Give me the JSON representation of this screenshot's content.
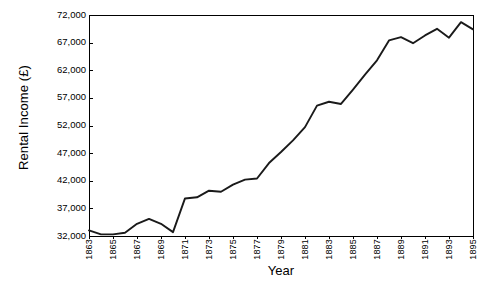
{
  "chart_data": {
    "type": "line",
    "title": "",
    "xlabel": "Year",
    "ylabel": "Rental Income (£)",
    "xlim": [
      1863,
      1895
    ],
    "ylim": [
      32000,
      72000
    ],
    "grid": false,
    "legend": "none",
    "ytick_labels": [
      "72,000",
      "67,000",
      "62,000",
      "57,000",
      "52,000",
      "47,000",
      "42,000",
      "37,000",
      "32,000"
    ],
    "ytick_values": [
      72000,
      67000,
      62000,
      57000,
      52000,
      47000,
      42000,
      37000,
      32000
    ],
    "xtick_labels": [
      "1863",
      "1865",
      "1867",
      "1869",
      "1871",
      "1873",
      "1875",
      "1877",
      "1879",
      "1881",
      "1883",
      "1885",
      "1887",
      "1889",
      "1891",
      "1893",
      "1895"
    ],
    "xtick_values": [
      1863,
      1865,
      1867,
      1869,
      1871,
      1873,
      1875,
      1877,
      1879,
      1881,
      1883,
      1885,
      1887,
      1889,
      1891,
      1893,
      1895
    ],
    "series": [
      {
        "name": "Rental Income",
        "color": "#1a1a1a",
        "x": [
          1863,
          1864,
          1865,
          1866,
          1867,
          1868,
          1869,
          1870,
          1871,
          1872,
          1873,
          1874,
          1875,
          1876,
          1877,
          1878,
          1879,
          1880,
          1881,
          1882,
          1883,
          1884,
          1885,
          1886,
          1887,
          1888,
          1889,
          1890,
          1891,
          1892,
          1893,
          1894,
          1895
        ],
        "values": [
          33000,
          32300,
          32300,
          32600,
          34200,
          35100,
          34200,
          32700,
          38800,
          39000,
          40200,
          40000,
          41300,
          42200,
          42400,
          45200,
          47200,
          49300,
          51700,
          55600,
          56300,
          55900,
          58500,
          61200,
          63800,
          67400,
          68000,
          66900,
          68300,
          69500,
          67900,
          70700,
          69400
        ]
      }
    ]
  },
  "axes": {
    "frame_color": "#000000"
  }
}
